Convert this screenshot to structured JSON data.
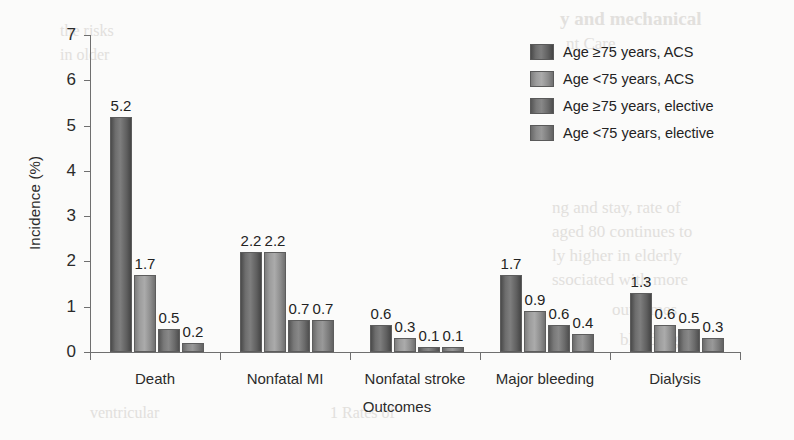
{
  "chart_data": {
    "type": "bar",
    "title": "",
    "subtitle": "",
    "xlabel": "Outcomes",
    "ylabel": "Incidence (%)",
    "ylim": [
      0,
      7
    ],
    "yticks": [
      "0",
      "1",
      "2",
      "3",
      "4",
      "5",
      "6",
      "7"
    ],
    "grid": false,
    "legend_position": "top-right",
    "categories": [
      "Death",
      "Nonfatal MI",
      "Nonfatal stroke",
      "Major bleeding",
      "Dialysis"
    ],
    "series": [
      {
        "name": "Age ≥75 years, ACS",
        "values": [
          5.2,
          2.2,
          0.6,
          1.7,
          1.3
        ],
        "color": "#6d6d6d"
      },
      {
        "name": "Age <75 years, ACS",
        "values": [
          1.7,
          2.2,
          0.3,
          0.9,
          0.6
        ],
        "color": "#a3a3a3"
      },
      {
        "name": "Age ≥75 years, elective",
        "values": [
          0.5,
          0.7,
          0.1,
          0.6,
          0.5
        ],
        "color": "#7d7d7d"
      },
      {
        "name": "Age <75 years, elective",
        "values": [
          0.2,
          0.7,
          0.1,
          0.4,
          0.3
        ],
        "color": "#8f8f8f"
      }
    ],
    "data_labels": [
      [
        "5.2",
        "1.7",
        "0.5",
        "0.2"
      ],
      [
        "2.2",
        "2.2",
        "0.7",
        "0.7"
      ],
      [
        "0.6",
        "0.3",
        "0.1",
        "0.1"
      ],
      [
        "1.7",
        "0.9",
        "0.6",
        "0.4"
      ],
      [
        "1.3",
        "0.6",
        "0.5",
        "0.3"
      ]
    ]
  },
  "legend": {
    "items": [
      {
        "label": "Age ≥75 years, ACS"
      },
      {
        "label": "Age <75 years, ACS"
      },
      {
        "label": "Age ≥75 years, elective"
      },
      {
        "label": "Age <75 years, elective"
      }
    ]
  },
  "scan_artifacts": {
    "t1": "y and mechanical",
    "t2": "nt Care",
    "t3": "ng and stay, rate of",
    "t4": "aged 80 continues to",
    "t5": "ly higher in elderly",
    "t6": "ssociated with more",
    "t7": "the risks",
    "t8": "in older",
    "t9": "ventricular",
    "t10": "1 Rates of",
    "t11": "bleeding",
    "t12": "outcomes"
  }
}
